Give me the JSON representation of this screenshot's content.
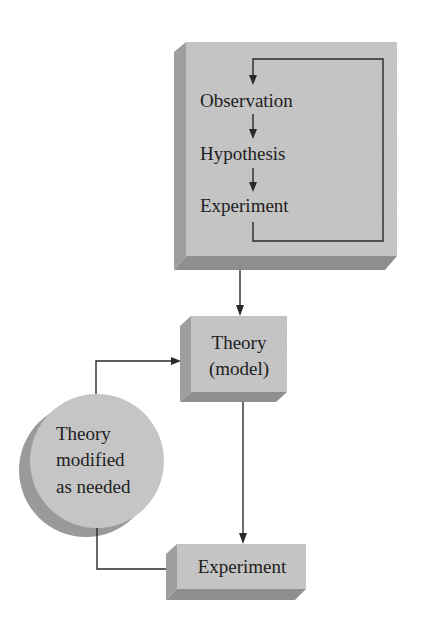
{
  "diagram": {
    "colors": {
      "background": "#ffffff",
      "face": "#c4c4c4",
      "shadow_side": "#9e9e9e",
      "shadow_bottom": "#8f8f8f",
      "circle_face": "#c6c6c6",
      "circle_shadow": "#9a9a9a",
      "line": "#2a2a2a",
      "text": "#1e1e1e"
    },
    "process_box": {
      "steps": [
        {
          "label": "Observation"
        },
        {
          "label": "Hypothesis"
        },
        {
          "label": "Experiment"
        }
      ],
      "loop": "Experiment returns to Observation"
    },
    "theory_box": {
      "line1": "Theory",
      "line2": "(model)"
    },
    "modify_circle": {
      "line1": "Theory",
      "line2": "modified",
      "line3": "as needed"
    },
    "experiment_box": {
      "label": "Experiment"
    },
    "edges": [
      {
        "from": "process_box",
        "to": "theory_box"
      },
      {
        "from": "theory_box",
        "to": "experiment_box"
      },
      {
        "from": "experiment_box",
        "to": "modify_circle"
      },
      {
        "from": "modify_circle",
        "to": "theory_box"
      }
    ]
  }
}
